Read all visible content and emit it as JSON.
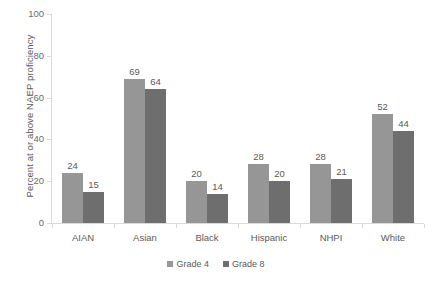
{
  "chart_data": {
    "type": "bar",
    "title": "",
    "xlabel": "",
    "ylabel": "Percent at or above NAEP proficiency",
    "categories": [
      "AIAN",
      "Asian",
      "Black",
      "Hispanic",
      "NHPI",
      "White"
    ],
    "series": [
      {
        "name": "Grade 4",
        "color": "#969696",
        "values": [
          24,
          69,
          20,
          28,
          28,
          52
        ]
      },
      {
        "name": "Grade 8",
        "color": "#6e6e6e",
        "values": [
          15,
          64,
          14,
          20,
          21,
          44
        ]
      }
    ],
    "ylim": [
      0,
      100
    ],
    "yticks": [
      0,
      20,
      40,
      60,
      80,
      100
    ],
    "ytick_labels": [
      "0",
      "20",
      "40",
      "60",
      "80",
      "100"
    ],
    "grid": false,
    "data_labels": true,
    "legend_position": "bottom"
  },
  "axes": {
    "y_title": "Percent at or above NAEP proficiency"
  },
  "legend": {
    "items": [
      {
        "label": "Grade 4"
      },
      {
        "label": "Grade 8"
      }
    ]
  }
}
